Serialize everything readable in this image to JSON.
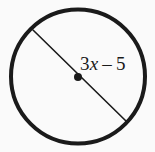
{
  "figure": {
    "kind": "geometry-diagram",
    "background_color": "#fafafa",
    "stroke_color": "#1a1a1a",
    "width": 155,
    "height": 152
  },
  "circle": {
    "name": "circle-outline",
    "center_x": 78,
    "center_y": 76.5,
    "radius": 67,
    "stroke_width": 4,
    "fill": "none",
    "color": "#1a1a1a"
  },
  "center_point": {
    "name": "center-dot",
    "x": 78,
    "y": 77,
    "radius": 4,
    "color": "#1a1a1a"
  },
  "diameter": {
    "name": "diameter-segment",
    "x1": 33,
    "y1": 30,
    "x2": 127,
    "y2": 122,
    "stroke_width": 1.6,
    "color": "#1a1a1a"
  },
  "label": {
    "name": "diameter-measure-label",
    "full_text": "3x – 5",
    "coefficient": "3",
    "variable": "x",
    "operator": "–",
    "constant": "5",
    "x": 80,
    "y": 70,
    "font_size": 19
  }
}
